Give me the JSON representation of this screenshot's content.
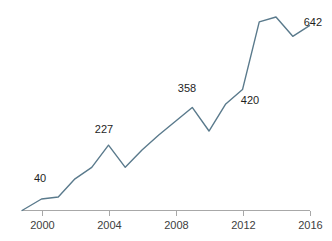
{
  "chart_data": {
    "type": "line",
    "title": "",
    "subtitle": "",
    "xlabel": "",
    "ylabel": "",
    "grid": false,
    "legend": false,
    "legend_position": "none",
    "xlim": [
      1999,
      2016
    ],
    "ylim": [
      0,
      700
    ],
    "x": [
      1999,
      2000,
      2001,
      2002,
      2003,
      2004,
      2005,
      2006,
      2007,
      2008,
      2009,
      2010,
      2011,
      2012,
      2013,
      2014,
      2015,
      2016
    ],
    "values": [
      0,
      40,
      47,
      110,
      150,
      227,
      150,
      210,
      262,
      310,
      358,
      276,
      370,
      420,
      655,
      672,
      605,
      642
    ],
    "series": [
      {
        "name": "series-1",
        "color": "#5a7a8c",
        "values": [
          0,
          40,
          47,
          110,
          150,
          227,
          150,
          210,
          262,
          310,
          358,
          276,
          370,
          420,
          655,
          672,
          605,
          642
        ]
      }
    ],
    "xticks": [
      2000,
      2004,
      2008,
      2012,
      2016
    ],
    "xtick_labels": [
      "2000",
      "2004",
      "2008",
      "2012",
      "2016"
    ],
    "yticks": [],
    "ytick_labels": [],
    "data_labels": [
      {
        "name": "label-40",
        "text": "40",
        "x": 1999.8,
        "y": 40,
        "px": 40,
        "py": 182
      },
      {
        "name": "label-227",
        "text": "227",
        "x": 2004,
        "y": 227,
        "px": 104,
        "py": 133
      },
      {
        "name": "label-358",
        "text": "358",
        "x": 2009,
        "y": 358,
        "px": 187,
        "py": 92
      },
      {
        "name": "label-420",
        "text": "420",
        "x": 2012,
        "y": 420,
        "px": 250,
        "py": 104
      },
      {
        "name": "label-642",
        "text": "642",
        "x": 2016,
        "y": 642,
        "px": 322,
        "py": 26
      }
    ],
    "colors": {
      "line": "#5a7a8c",
      "axis": "#a8a8a8",
      "tick_text": "#404040",
      "label_text": "#1e1e1e",
      "background": "#ffffff"
    }
  }
}
